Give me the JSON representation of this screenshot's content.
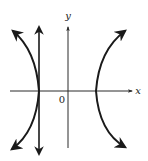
{
  "figure": {
    "type": "hyperbola graph",
    "colors": {
      "ink": "#1a1a1a",
      "axis": "#2a2a2a",
      "background": "#ffffff"
    },
    "axes": {
      "x_label": "x",
      "y_label": "y",
      "origin_label": "0"
    },
    "curves": [
      {
        "name": "left-branch",
        "description": "Left branch of hyperbola opening left, arrows at both ends"
      },
      {
        "name": "right-branch",
        "description": "Right branch of hyperbola opening right, arrows at both ends"
      },
      {
        "name": "vertical-line",
        "description": "Vertical line tangent at left vertex, double-headed arrow"
      }
    ]
  }
}
